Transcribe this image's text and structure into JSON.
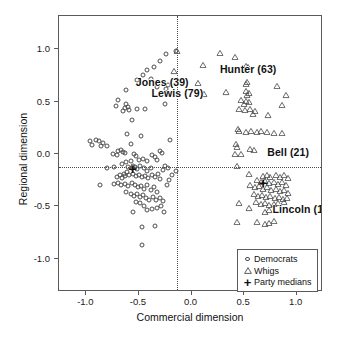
{
  "chart_data": {
    "type": "scatter",
    "title": "",
    "xlabel": "Commercial dimension",
    "ylabel": "Regional dimension",
    "xlim": [
      -1.26,
      1.25
    ],
    "ylim": [
      -1.32,
      1.32
    ],
    "xticks": [
      -1.0,
      -0.5,
      0.0,
      0.5,
      1.0
    ],
    "xticklabels": [
      "-1.0",
      "-0.5",
      "0.0",
      "0.5",
      "1.0"
    ],
    "yticks": [
      1.0,
      0.5,
      0.0,
      -0.5,
      -1.0
    ],
    "yticklabels": [
      "1.0",
      "0.5",
      "0.0",
      "-0.5",
      "-1.0"
    ],
    "grid": false,
    "reference_lines": {
      "vertical_x": -0.14,
      "horizontal_y": -0.12,
      "style": "dotted"
    },
    "legend": {
      "position": "bottom-right",
      "entries": [
        {
          "label": "Democrats",
          "marker": "circle"
        },
        {
          "label": "Whigs",
          "marker": "triangle"
        },
        {
          "label": "Party medians",
          "marker": "plus"
        }
      ]
    },
    "annotations": [
      {
        "text": "Jones (39)",
        "x": -0.53,
        "y": 0.69
      },
      {
        "text": "Lewis (79)",
        "x": -0.38,
        "y": 0.58
      },
      {
        "text": "Hunter (63)",
        "x": 0.27,
        "y": 0.81
      },
      {
        "text": "Bell (21)",
        "x": 0.72,
        "y": 0.02
      },
      {
        "text": "Lincoln (11)",
        "x": 0.77,
        "y": -0.53
      }
    ],
    "series": [
      {
        "name": "Democrats",
        "marker": "circle",
        "points": [
          [
            -0.24,
            0.96
          ],
          [
            -0.15,
            0.99
          ],
          [
            -0.3,
            0.89
          ],
          [
            -0.36,
            0.83
          ],
          [
            -0.42,
            0.8
          ],
          [
            -0.46,
            0.76
          ],
          [
            -0.39,
            0.72
          ],
          [
            -0.52,
            0.71
          ],
          [
            -0.26,
            0.67
          ],
          [
            -0.22,
            0.66
          ],
          [
            -0.62,
            0.61
          ],
          [
            -0.24,
            0.62
          ],
          [
            -0.33,
            0.64
          ],
          [
            -0.7,
            0.52
          ],
          [
            -0.25,
            0.48
          ],
          [
            -0.72,
            0.46
          ],
          [
            -0.62,
            0.48
          ],
          [
            -0.6,
            0.45
          ],
          [
            -0.59,
            0.42
          ],
          [
            -0.63,
            0.44
          ],
          [
            -0.65,
            0.41
          ],
          [
            -0.52,
            0.43
          ],
          [
            -0.44,
            0.43
          ],
          [
            -0.2,
            0.13
          ],
          [
            -0.57,
            0.33
          ],
          [
            -0.48,
            0.17
          ],
          [
            -0.61,
            0.19
          ],
          [
            -0.58,
            0.1
          ],
          [
            -0.97,
            0.12
          ],
          [
            -0.95,
            0.09
          ],
          [
            -0.91,
            0.13
          ],
          [
            -0.88,
            0.12
          ],
          [
            -0.84,
            0.11
          ],
          [
            -0.8,
            0.08
          ],
          [
            -0.86,
            0.08
          ],
          [
            -0.7,
            0.03
          ],
          [
            -0.67,
            0.04
          ],
          [
            -0.65,
            0.02
          ],
          [
            -0.63,
            0.01
          ],
          [
            -0.71,
            -0.01
          ],
          [
            -0.75,
            0.0
          ],
          [
            -0.55,
            0.0
          ],
          [
            -0.53,
            -0.02
          ],
          [
            -0.38,
            -0.01
          ],
          [
            -0.35,
            -0.03
          ],
          [
            -0.3,
            0.03
          ],
          [
            -0.28,
            0.01
          ],
          [
            -0.33,
            -0.06
          ],
          [
            -0.42,
            -0.07
          ],
          [
            -0.46,
            -0.05
          ],
          [
            -0.5,
            -0.06
          ],
          [
            -0.58,
            -0.07
          ],
          [
            -0.62,
            -0.08
          ],
          [
            -0.66,
            -0.1
          ],
          [
            -0.74,
            -0.12
          ],
          [
            -0.8,
            -0.13
          ],
          [
            -0.6,
            -0.12
          ],
          [
            -0.57,
            -0.13
          ],
          [
            -0.56,
            -0.11
          ],
          [
            -0.54,
            -0.12
          ],
          [
            -0.52,
            -0.14
          ],
          [
            -0.49,
            -0.11
          ],
          [
            -0.45,
            -0.13
          ],
          [
            -0.42,
            -0.16
          ],
          [
            -0.39,
            -0.13
          ],
          [
            -0.25,
            -0.11
          ],
          [
            -0.22,
            -0.13
          ],
          [
            -0.27,
            -0.15
          ],
          [
            -0.15,
            -0.16
          ],
          [
            -0.61,
            -0.17
          ],
          [
            -0.64,
            -0.19
          ],
          [
            -0.68,
            -0.2
          ],
          [
            -0.71,
            -0.22
          ],
          [
            -0.66,
            -0.23
          ],
          [
            -0.63,
            -0.21
          ],
          [
            -0.59,
            -0.2
          ],
          [
            -0.56,
            -0.19
          ],
          [
            -0.53,
            -0.21
          ],
          [
            -0.5,
            -0.2
          ],
          [
            -0.47,
            -0.22
          ],
          [
            -0.44,
            -0.21
          ],
          [
            -0.41,
            -0.23
          ],
          [
            -0.38,
            -0.2
          ],
          [
            -0.35,
            -0.22
          ],
          [
            -0.32,
            -0.19
          ],
          [
            -0.3,
            -0.24
          ],
          [
            -0.87,
            -0.3
          ],
          [
            -0.74,
            -0.29
          ],
          [
            -0.7,
            -0.28
          ],
          [
            -0.67,
            -0.3
          ],
          [
            -0.63,
            -0.29
          ],
          [
            -0.6,
            -0.31
          ],
          [
            -0.57,
            -0.28
          ],
          [
            -0.54,
            -0.3
          ],
          [
            -0.51,
            -0.32
          ],
          [
            -0.48,
            -0.31
          ],
          [
            -0.45,
            -0.33
          ],
          [
            -0.42,
            -0.3
          ],
          [
            -0.39,
            -0.34
          ],
          [
            -0.36,
            -0.32
          ],
          [
            -0.33,
            -0.36
          ],
          [
            -0.62,
            -0.36
          ],
          [
            -0.58,
            -0.38
          ],
          [
            -0.55,
            -0.4
          ],
          [
            -0.52,
            -0.38
          ],
          [
            -0.49,
            -0.41
          ],
          [
            -0.46,
            -0.39
          ],
          [
            -0.43,
            -0.42
          ],
          [
            -0.4,
            -0.44
          ],
          [
            -0.37,
            -0.41
          ],
          [
            -0.34,
            -0.44
          ],
          [
            -0.3,
            -0.42
          ],
          [
            -0.27,
            -0.45
          ],
          [
            -0.53,
            -0.46
          ],
          [
            -0.49,
            -0.47
          ],
          [
            -0.45,
            -0.5
          ],
          [
            -0.56,
            -0.55
          ],
          [
            -0.42,
            -0.54
          ],
          [
            -0.38,
            -0.53
          ],
          [
            -0.33,
            -0.52
          ],
          [
            -0.29,
            -0.5
          ],
          [
            -0.26,
            -0.55
          ],
          [
            -0.47,
            -0.7
          ],
          [
            -0.35,
            -0.69
          ],
          [
            -0.47,
            -0.87
          ],
          [
            -0.23,
            -0.3
          ],
          [
            -0.21,
            -0.25
          ],
          [
            -0.19,
            -0.2
          ]
        ]
      },
      {
        "name": "Whigs",
        "marker": "triangle",
        "points": [
          [
            0.27,
            0.97
          ],
          [
            -0.14,
            0.99
          ],
          [
            0.41,
            0.93
          ],
          [
            0.52,
            0.84
          ],
          [
            0.54,
            0.83
          ],
          [
            0.5,
            0.81
          ],
          [
            0.11,
            0.85
          ],
          [
            0.06,
            0.68
          ],
          [
            -0.17,
            0.79
          ],
          [
            0.53,
            0.69
          ],
          [
            0.52,
            0.67
          ],
          [
            0.81,
            0.65
          ],
          [
            0.12,
            0.57
          ],
          [
            0.33,
            0.59
          ],
          [
            0.52,
            0.6
          ],
          [
            0.55,
            0.58
          ],
          [
            0.53,
            0.56
          ],
          [
            0.9,
            0.56
          ],
          [
            0.47,
            0.52
          ],
          [
            0.52,
            0.51
          ],
          [
            0.55,
            0.5
          ],
          [
            0.5,
            0.48
          ],
          [
            0.86,
            0.47
          ],
          [
            0.45,
            0.43
          ],
          [
            0.51,
            0.42
          ],
          [
            0.56,
            0.43
          ],
          [
            0.6,
            0.41
          ],
          [
            0.58,
            0.38
          ],
          [
            0.73,
            0.37
          ],
          [
            0.44,
            0.24
          ],
          [
            0.45,
            0.22
          ],
          [
            0.52,
            0.21
          ],
          [
            0.57,
            0.22
          ],
          [
            0.62,
            0.21
          ],
          [
            0.66,
            0.22
          ],
          [
            0.72,
            0.21
          ],
          [
            0.78,
            0.2
          ],
          [
            0.86,
            0.2
          ],
          [
            0.42,
            0.1
          ],
          [
            0.43,
            0.07
          ],
          [
            0.56,
            0.05
          ],
          [
            0.59,
            0.04
          ],
          [
            0.41,
            0.0
          ],
          [
            0.47,
            0.0
          ],
          [
            0.43,
            -0.11
          ],
          [
            0.55,
            -0.19
          ],
          [
            0.68,
            -0.21
          ],
          [
            0.72,
            -0.2
          ],
          [
            0.75,
            -0.22
          ],
          [
            0.8,
            -0.2
          ],
          [
            0.84,
            -0.22
          ],
          [
            0.88,
            -0.2
          ],
          [
            0.92,
            -0.23
          ],
          [
            0.62,
            -0.25
          ],
          [
            0.66,
            -0.27
          ],
          [
            0.7,
            -0.26
          ],
          [
            0.74,
            -0.28
          ],
          [
            0.78,
            -0.27
          ],
          [
            0.82,
            -0.29
          ],
          [
            0.86,
            -0.27
          ],
          [
            0.9,
            -0.3
          ],
          [
            0.56,
            -0.3
          ],
          [
            0.6,
            -0.32
          ],
          [
            0.64,
            -0.31
          ],
          [
            0.68,
            -0.33
          ],
          [
            0.72,
            -0.32
          ],
          [
            0.76,
            -0.34
          ],
          [
            0.8,
            -0.33
          ],
          [
            0.84,
            -0.35
          ],
          [
            0.88,
            -0.34
          ],
          [
            0.92,
            -0.37
          ],
          [
            0.59,
            -0.38
          ],
          [
            0.63,
            -0.4
          ],
          [
            0.67,
            -0.39
          ],
          [
            0.71,
            -0.41
          ],
          [
            0.75,
            -0.4
          ],
          [
            0.79,
            -0.42
          ],
          [
            0.83,
            -0.41
          ],
          [
            0.87,
            -0.43
          ],
          [
            0.91,
            -0.42
          ],
          [
            0.45,
            -0.47
          ],
          [
            0.61,
            -0.46
          ],
          [
            0.66,
            -0.48
          ],
          [
            0.7,
            -0.47
          ],
          [
            0.74,
            -0.49
          ],
          [
            0.78,
            -0.48
          ],
          [
            0.82,
            -0.47
          ],
          [
            0.88,
            -0.46
          ],
          [
            0.55,
            -0.52
          ],
          [
            0.7,
            -0.55
          ],
          [
            0.74,
            -0.54
          ],
          [
            0.43,
            -0.65
          ],
          [
            0.62,
            -0.65
          ],
          [
            0.7,
            -0.67
          ],
          [
            0.74,
            -0.66
          ],
          [
            0.78,
            -0.64
          ]
        ]
      },
      {
        "name": "Party medians",
        "marker": "plus",
        "points": [
          [
            -0.56,
            -0.13
          ],
          [
            0.68,
            -0.27
          ]
        ]
      }
    ]
  }
}
